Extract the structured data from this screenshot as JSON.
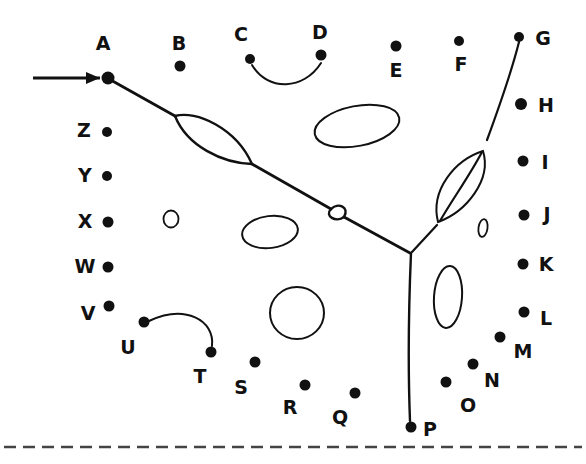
{
  "figure": {
    "width": 586,
    "height": 464,
    "background_color": "#ffffff",
    "ink_color": "#111111"
  },
  "nodes": [
    {
      "id": "A",
      "label": "A",
      "dot": {
        "x": 108,
        "y": 78,
        "r": 6.5
      },
      "label_pos": {
        "x": 103,
        "y": 44
      }
    },
    {
      "id": "B",
      "label": "B",
      "dot": {
        "x": 180,
        "y": 66,
        "r": 5.5
      },
      "label_pos": {
        "x": 179,
        "y": 44
      }
    },
    {
      "id": "C",
      "label": "C",
      "dot": {
        "x": 250,
        "y": 59,
        "r": 5.0
      },
      "label_pos": {
        "x": 241,
        "y": 35
      }
    },
    {
      "id": "D",
      "label": "D",
      "dot": {
        "x": 321,
        "y": 55,
        "r": 5.5
      },
      "label_pos": {
        "x": 320,
        "y": 33
      }
    },
    {
      "id": "E",
      "label": "E",
      "dot": {
        "x": 396,
        "y": 46,
        "r": 5.5
      },
      "label_pos": {
        "x": 396,
        "y": 71
      }
    },
    {
      "id": "F",
      "label": "F",
      "dot": {
        "x": 459,
        "y": 41,
        "r": 5.0
      },
      "label_pos": {
        "x": 461,
        "y": 65
      }
    },
    {
      "id": "G",
      "label": "G",
      "dot": {
        "x": 519,
        "y": 37,
        "r": 5.0
      },
      "label_pos": {
        "x": 543,
        "y": 39
      }
    },
    {
      "id": "H",
      "label": "H",
      "dot": {
        "x": 521,
        "y": 104,
        "r": 6.0
      },
      "label_pos": {
        "x": 546,
        "y": 106
      }
    },
    {
      "id": "I",
      "label": "I",
      "dot": {
        "x": 523,
        "y": 161,
        "r": 5.5
      },
      "label_pos": {
        "x": 545,
        "y": 163
      }
    },
    {
      "id": "J",
      "label": "J",
      "dot": {
        "x": 524,
        "y": 215,
        "r": 5.5
      },
      "label_pos": {
        "x": 547,
        "y": 215
      }
    },
    {
      "id": "K",
      "label": "K",
      "dot": {
        "x": 523,
        "y": 264,
        "r": 5.5
      },
      "label_pos": {
        "x": 546,
        "y": 265
      }
    },
    {
      "id": "L",
      "label": "L",
      "dot": {
        "x": 524,
        "y": 312,
        "r": 5.5
      },
      "label_pos": {
        "x": 546,
        "y": 319
      }
    },
    {
      "id": "M",
      "label": "M",
      "dot": {
        "x": 500,
        "y": 337,
        "r": 5.5
      },
      "label_pos": {
        "x": 523,
        "y": 352
      }
    },
    {
      "id": "N",
      "label": "N",
      "dot": {
        "x": 473,
        "y": 364,
        "r": 5.5
      },
      "label_pos": {
        "x": 492,
        "y": 381
      }
    },
    {
      "id": "O",
      "label": "O",
      "dot": {
        "x": 446,
        "y": 382,
        "r": 5.5
      },
      "label_pos": {
        "x": 468,
        "y": 406
      }
    },
    {
      "id": "P",
      "label": "P",
      "dot": {
        "x": 411,
        "y": 427,
        "r": 5.5
      },
      "label_pos": {
        "x": 430,
        "y": 430
      }
    },
    {
      "id": "Q",
      "label": "Q",
      "dot": {
        "x": 355,
        "y": 393,
        "r": 5.5
      },
      "label_pos": {
        "x": 340,
        "y": 418
      }
    },
    {
      "id": "R",
      "label": "R",
      "dot": {
        "x": 305,
        "y": 385,
        "r": 5.5
      },
      "label_pos": {
        "x": 290,
        "y": 408
      }
    },
    {
      "id": "S",
      "label": "S",
      "dot": {
        "x": 255,
        "y": 362,
        "r": 5.5
      },
      "label_pos": {
        "x": 241,
        "y": 388
      }
    },
    {
      "id": "T",
      "label": "T",
      "dot": {
        "x": 211,
        "y": 352,
        "r": 5.5
      },
      "label_pos": {
        "x": 200,
        "y": 377
      }
    },
    {
      "id": "U",
      "label": "U",
      "dot": {
        "x": 144,
        "y": 322,
        "r": 5.5
      },
      "label_pos": {
        "x": 128,
        "y": 348
      }
    },
    {
      "id": "V",
      "label": "V",
      "dot": {
        "x": 109,
        "y": 306,
        "r": 5.5
      },
      "label_pos": {
        "x": 88,
        "y": 314
      }
    },
    {
      "id": "W",
      "label": "W",
      "dot": {
        "x": 108,
        "y": 267,
        "r": 5.5
      },
      "label_pos": {
        "x": 85,
        "y": 267
      }
    },
    {
      "id": "X",
      "label": "X",
      "dot": {
        "x": 108,
        "y": 222,
        "r": 5.5
      },
      "label_pos": {
        "x": 85,
        "y": 222
      }
    },
    {
      "id": "Y",
      "label": "Y",
      "dot": {
        "x": 107,
        "y": 176,
        "r": 5.0
      },
      "label_pos": {
        "x": 85,
        "y": 176
      }
    },
    {
      "id": "Z",
      "label": "Z",
      "dot": {
        "x": 107,
        "y": 132,
        "r": 5.0
      },
      "label_pos": {
        "x": 84,
        "y": 131
      }
    }
  ],
  "strokes": {
    "entry_arrow": {
      "name": "entry-arrow",
      "path": "M 33 78 L 100 78",
      "arrowhead": "M 100 78 L 86 72 L 86 84 Z"
    },
    "main_branch_left": {
      "name": "left-branch-curve",
      "path": "M 109 79 L 175 116 M 252 164 L 331 209 M 344 217 L 410 253"
    },
    "main_branch_right": {
      "name": "right-branch-curve",
      "path": "M 519 42 C 512 70 498 110 487 140 M 482 152 C 470 175 452 200 440 221 M 437 225 L 412 252"
    },
    "main_stem": {
      "name": "stem-vertical",
      "path": "M 411 253 C 409 300 408 370 410 421"
    },
    "lens_large_left": {
      "name": "loop-lens-upper-left",
      "path": "M 175 116 C 196 110 236 128 252 164 C 222 163 187 146 175 116 Z"
    },
    "lens_small_mid": {
      "name": "loop-lens-middle",
      "path": "M 331 209 C 338 202 350 207 344 217 C 336 223 324 216 331 209 Z"
    },
    "lens_right": {
      "name": "loop-lens-right",
      "path": "M 483 151 C 455 160 430 190 438 222 C 466 212 492 180 483 151 Z"
    },
    "arc_cd": {
      "name": "arc-c-to-d",
      "path": "M 252 65 C 268 92 304 90 321 63"
    },
    "arc_ut": {
      "name": "arc-u-to-t",
      "path": "M 149 321 C 185 304 215 320 212 346"
    }
  },
  "blobs": [
    {
      "name": "ellipse-tilted-top",
      "cx": 357,
      "cy": 126,
      "rx": 43,
      "ry": 20,
      "rotate": -11
    },
    {
      "name": "ellipse-small-circle-left",
      "cx": 171,
      "cy": 219,
      "rx": 7.5,
      "ry": 8.5,
      "rotate": 0
    },
    {
      "name": "ellipse-mid-left",
      "cx": 270,
      "cy": 232,
      "rx": 28,
      "ry": 16,
      "rotate": -7
    },
    {
      "name": "circle-lower-mid",
      "cx": 297,
      "cy": 313,
      "rx": 27,
      "ry": 26,
      "rotate": 0
    },
    {
      "name": "ellipse-vertical-right",
      "cx": 448,
      "cy": 297,
      "rx": 14,
      "ry": 31,
      "rotate": 4
    },
    {
      "name": "glyph-zero-right",
      "cx": 483,
      "cy": 228,
      "rx": 4.5,
      "ry": 9,
      "rotate": 8
    }
  ],
  "baseline": {
    "name": "dashed-baseline",
    "y": 447,
    "x_start": 4,
    "x_end": 582,
    "dash": "12 7",
    "width": 2.5
  }
}
